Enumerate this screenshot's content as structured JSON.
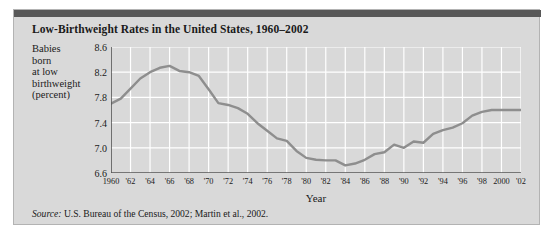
{
  "figure": {
    "title": "Low-Birthweight Rates in the United States, 1960–2002",
    "source_label": "Source:",
    "source_text": " U.S. Bureau of the Census, 2002; Martin et al., 2002.",
    "colors": {
      "card_background": "#d9d9d9",
      "header_bar": "#585858",
      "line": "#8e8e8e",
      "gridline": "#ffffff",
      "axis": "#555555",
      "text": "#1a1a1a"
    }
  },
  "chart_data": {
    "type": "line",
    "title": "Low-Birthweight Rates in the United States, 1960–2002",
    "xlabel": "Year",
    "ylabel": "Babies born at low birthweight (percent)",
    "ylabel_lines": [
      "Babies",
      "born",
      "at low",
      "birthweight",
      "(percent)"
    ],
    "ylim": [
      6.6,
      8.6
    ],
    "xlim": [
      1960,
      2002
    ],
    "yticks": [
      "8.6",
      "8.2",
      "7.8",
      "7.4",
      "7.0",
      "6.6"
    ],
    "ytick_values": [
      8.6,
      8.2,
      7.8,
      7.4,
      7.0,
      6.6
    ],
    "xticks": [
      "1960",
      "'62",
      "'64",
      "'66",
      "'68",
      "'70",
      "'72",
      "'74",
      "'76",
      "'78",
      "'80",
      "'82",
      "'84",
      "'86",
      "'88",
      "'90",
      "'92",
      "'94",
      "'96",
      "'98",
      "2000",
      "'02"
    ],
    "xtick_values": [
      1960,
      1962,
      1964,
      1966,
      1968,
      1970,
      1972,
      1974,
      1976,
      1978,
      1980,
      1982,
      1984,
      1986,
      1988,
      1990,
      1992,
      1994,
      1996,
      1998,
      2000,
      2002
    ],
    "grid": true,
    "legend": "none",
    "x": [
      1960,
      1961,
      1962,
      1963,
      1964,
      1965,
      1966,
      1967,
      1968,
      1969,
      1970,
      1971,
      1972,
      1973,
      1974,
      1975,
      1976,
      1977,
      1978,
      1979,
      1980,
      1981,
      1982,
      1983,
      1984,
      1985,
      1986,
      1987,
      1988,
      1989,
      1990,
      1991,
      1992,
      1993,
      1994,
      1995,
      1996,
      1997,
      1998,
      1999,
      2000,
      2001,
      2002
    ],
    "values": [
      7.7,
      7.78,
      7.94,
      8.1,
      8.2,
      8.27,
      8.3,
      8.22,
      8.2,
      8.14,
      7.93,
      7.71,
      7.68,
      7.63,
      7.54,
      7.39,
      7.27,
      7.15,
      7.11,
      6.95,
      6.84,
      6.81,
      6.8,
      6.8,
      6.72,
      6.75,
      6.81,
      6.9,
      6.93,
      7.05,
      7.0,
      7.1,
      7.08,
      7.22,
      7.28,
      7.32,
      7.39,
      7.51,
      7.57,
      7.6,
      7.6,
      7.6,
      7.6
    ],
    "series": [
      {
        "name": "Low-birthweight rate",
        "values": [
          7.7,
          7.78,
          7.94,
          8.1,
          8.2,
          8.27,
          8.3,
          8.22,
          8.2,
          8.14,
          7.93,
          7.71,
          7.68,
          7.63,
          7.54,
          7.39,
          7.27,
          7.15,
          7.11,
          6.95,
          6.84,
          6.81,
          6.8,
          6.8,
          6.72,
          6.75,
          6.81,
          6.9,
          6.93,
          7.05,
          7.0,
          7.1,
          7.08,
          7.22,
          7.28,
          7.32,
          7.39,
          7.51,
          7.57,
          7.6,
          7.6,
          7.6,
          7.6
        ]
      }
    ]
  }
}
